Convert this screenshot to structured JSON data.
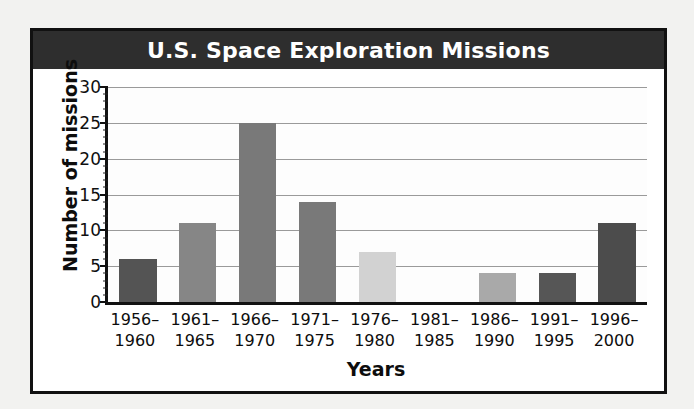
{
  "poster": {
    "title": "U.S. Space Exploration Missions",
    "title_bar_color": "#2e2e2e",
    "title_text_color": "#ffffff",
    "frame_color": "#111111",
    "background_color": "#ffffff"
  },
  "chart_data": {
    "type": "bar",
    "title": "U.S. Space Exploration Missions",
    "xlabel": "Years",
    "ylabel": "Number of missions",
    "categories": [
      "1956-1960",
      "1961-1965",
      "1966-1970",
      "1971-1975",
      "1976-1980",
      "1981-1985",
      "1986-1990",
      "1991-1995",
      "1996-2000"
    ],
    "category_lines": [
      [
        "1956–",
        "1960"
      ],
      [
        "1961–",
        "1965"
      ],
      [
        "1966–",
        "1970"
      ],
      [
        "1971–",
        "1975"
      ],
      [
        "1976–",
        "1980"
      ],
      [
        "1981–",
        "1985"
      ],
      [
        "1986–",
        "1990"
      ],
      [
        "1991–",
        "1995"
      ],
      [
        "1996–",
        "2000"
      ]
    ],
    "values": [
      6,
      11,
      25,
      14,
      7,
      0,
      4,
      4,
      11
    ],
    "bar_colors": [
      "#545454",
      "#868686",
      "#797979",
      "#797979",
      "#d2d2d2",
      "#ffffff",
      "#a9a9a9",
      "#565656",
      "#4c4c4c"
    ],
    "ylim": [
      0,
      30
    ],
    "yticks": [
      0,
      5,
      10,
      15,
      20,
      25,
      30
    ],
    "ytick_labels": [
      "0",
      "5",
      "10",
      "15",
      "20",
      "25",
      "30"
    ],
    "y_minor_tick_step": 1,
    "grid": true,
    "grid_color": "#9a9a9a",
    "legend": null
  }
}
